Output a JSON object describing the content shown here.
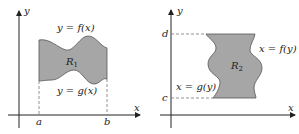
{
  "figure_left": {
    "axis_x_label": "x",
    "axis_y_label": "y",
    "top_curve_label": "y = f(x)",
    "bottom_curve_label": "y = g(x)",
    "region_label": "R",
    "region_subscript": "1",
    "bound_left": "a",
    "bound_right": "b"
  },
  "figure_right": {
    "axis_x_label": "x",
    "axis_y_label": "y",
    "right_curve_label": "x = f(y)",
    "left_curve_label": "x = g(y)",
    "region_label": "R",
    "region_subscript": "2",
    "bound_top": "d",
    "bound_bottom": "c"
  },
  "colors": {
    "region_fill": "#a6a6a6",
    "region_stroke": "#555555",
    "axis": "#222222",
    "dashed": "#777777"
  }
}
